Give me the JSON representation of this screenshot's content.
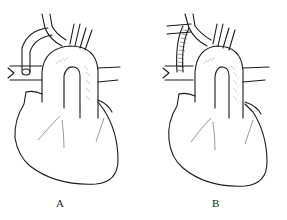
{
  "figure": {
    "panels": [
      {
        "id": "A",
        "label": "A",
        "description": "Heart with curved native arterial conduit from aortic arch branch to pulmonary artery"
      },
      {
        "id": "B",
        "label": "B",
        "description": "Heart with ringed synthetic tube graft from subclavian branch to pulmonary artery"
      }
    ],
    "caption": ""
  },
  "colors": {
    "line": "#1a1a1a",
    "background": "#ffffff"
  }
}
